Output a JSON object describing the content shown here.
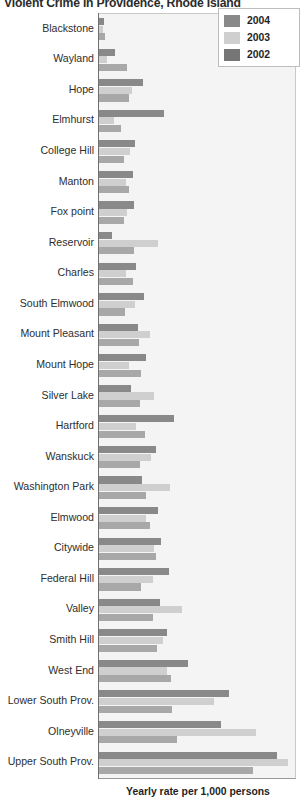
{
  "chart_data": {
    "type": "bar",
    "orientation": "horizontal",
    "title": "Violent Crime in Providence, Rhode Island",
    "xlabel": "Yearly rate per 1,000 persons",
    "ylabel": "",
    "grid": false,
    "legend_position": "top-right",
    "xlim": [
      0,
      40
    ],
    "categories": [
      "Blackstone",
      "Wayland",
      "Hope",
      "Elmhurst",
      "College Hill",
      "Manton",
      "Fox point",
      "Reservoir",
      "Charles",
      "South Elmwood",
      "Mount Pleasant",
      "Mount Hope",
      "Silver Lake",
      "Hartford",
      "Wanskuck",
      "Washington Park",
      "Elmwood",
      "Citywide",
      "Federal Hill",
      "Valley",
      "Smith Hill",
      "West End",
      "Lower South Prov.",
      "Olneyville",
      "Upper South Prov."
    ],
    "series": [
      {
        "name": "2004",
        "color": "#898989",
        "values": [
          1.0,
          3.2,
          9.0,
          13.2,
          7.4,
          7.0,
          7.2,
          2.6,
          7.6,
          9.2,
          8.0,
          9.6,
          6.6,
          15.4,
          11.6,
          8.8,
          12.0,
          12.6,
          14.2,
          12.4,
          13.8,
          18.2,
          26.6,
          24.8,
          36.4
        ]
      },
      {
        "name": "2003",
        "color": "#cfcfcf",
        "values": [
          0.8,
          1.6,
          6.8,
          3.0,
          6.4,
          5.6,
          5.8,
          12.0,
          5.6,
          7.4,
          10.4,
          6.2,
          11.2,
          7.6,
          10.6,
          14.4,
          9.6,
          11.2,
          11.0,
          17.0,
          13.0,
          13.8,
          23.4,
          32.0,
          38.6
        ]
      },
      {
        "name": "2002",
        "color": "#a8a8a8",
        "values": [
          1.2,
          5.8,
          6.2,
          4.4,
          5.2,
          6.2,
          5.0,
          7.2,
          7.0,
          5.4,
          8.2,
          8.6,
          8.4,
          9.4,
          8.4,
          9.6,
          10.4,
          11.6,
          8.6,
          11.0,
          11.8,
          14.6,
          14.8,
          16.0,
          31.4
        ]
      }
    ]
  },
  "legend": {
    "items": [
      {
        "label": "2004",
        "key": "y2004"
      },
      {
        "label": "2003",
        "key": "y2003"
      },
      {
        "label": "2002",
        "key": "y2002"
      }
    ]
  }
}
